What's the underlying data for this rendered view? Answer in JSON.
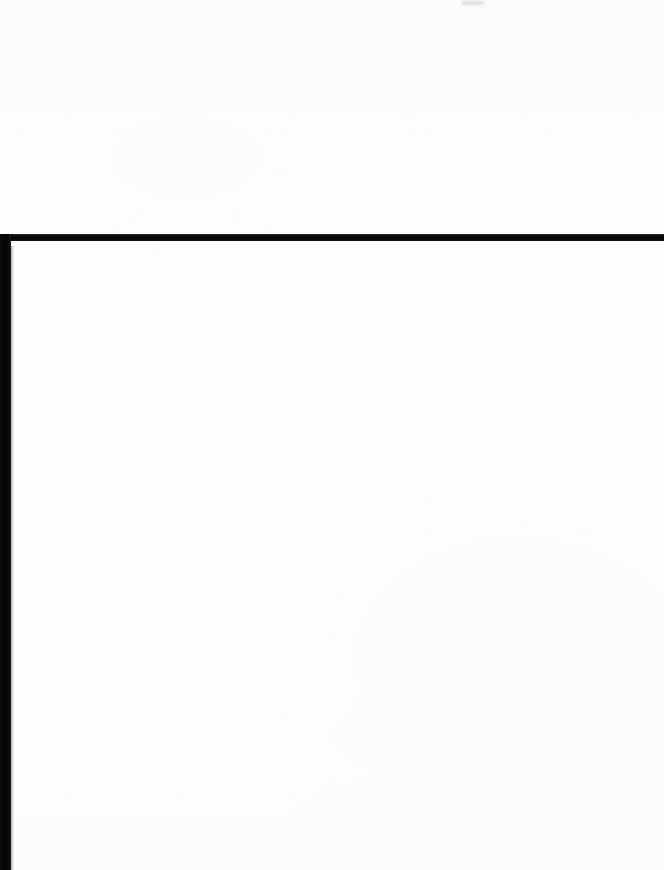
{
  "document": {
    "kind": "scanned-page",
    "page_state": "blank",
    "visible_text": "",
    "notes_text": ""
  },
  "canvas": {
    "width": 664,
    "height": 870,
    "background_color": "#fdfdfd",
    "paper_color": "#fdfdfd"
  },
  "regions": {
    "upper_panel": {
      "label": "",
      "top": 0,
      "height": 234,
      "text": ""
    },
    "lower_panel": {
      "label": "",
      "top": 241,
      "height": 629,
      "text": ""
    }
  },
  "artifacts": {
    "edge_color": "#050505",
    "horizontal_rule": {
      "name": "scan-edge-horizontal-rule",
      "left": 10,
      "top": 234,
      "width": 654,
      "height": 7
    },
    "vertical_band": {
      "name": "scan-edge-vertical-band",
      "left": 0,
      "top": 234,
      "width": 11,
      "height": 636
    },
    "trim_mark": {
      "name": "top-trim-mark",
      "left": 462,
      "top": 1,
      "width": 22,
      "height": 4,
      "color": "#c6c6ca"
    }
  }
}
